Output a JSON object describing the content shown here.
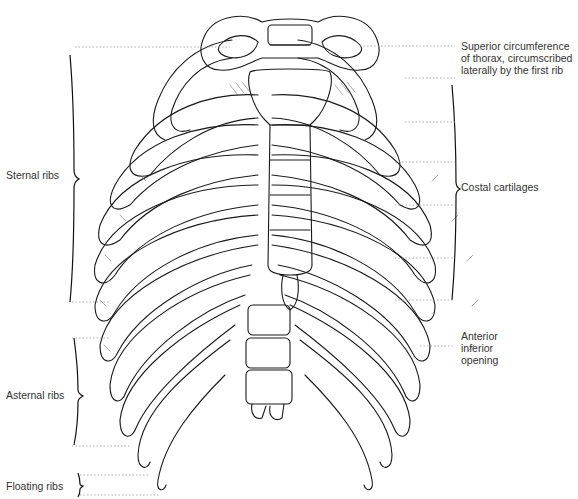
{
  "figure": {
    "style": "pen-and-ink anatomical illustration",
    "colors": {
      "ink": "#1a1a1a",
      "background": "#ffffff",
      "leader": "#9a9a9a",
      "label": "#333333"
    }
  },
  "labels": {
    "left": [
      {
        "id": "sternal-ribs",
        "text": "Sternal ribs"
      },
      {
        "id": "asternal-ribs",
        "text": "Asternal ribs"
      },
      {
        "id": "floating-ribs",
        "text": "Floating ribs"
      }
    ],
    "right": [
      {
        "id": "superior-circumference",
        "text": "Superior circumference\nof thorax, circumscribed\nlaterally by the first rib"
      },
      {
        "id": "costal-cartilages",
        "text": "Costal cartilages"
      },
      {
        "id": "anterior-inferior-opening",
        "text": "Anterior\ninferior\nopening"
      }
    ]
  }
}
